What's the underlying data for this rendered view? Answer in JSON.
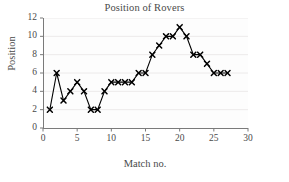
{
  "chart_data": {
    "type": "line",
    "title": "Position of Rovers",
    "xlabel": "Match no.",
    "ylabel": "Position",
    "x": [
      1,
      2,
      3,
      4,
      5,
      6,
      7,
      8,
      9,
      10,
      11,
      12,
      13,
      14,
      15,
      16,
      17,
      18,
      19,
      20,
      21,
      22,
      23,
      24,
      25,
      26,
      27
    ],
    "values": [
      2,
      6,
      3,
      4,
      5,
      4,
      2,
      2,
      4,
      5,
      5,
      5,
      5,
      6,
      6,
      8,
      9,
      10,
      10,
      11,
      10,
      8,
      8,
      7,
      6,
      6,
      6
    ],
    "series": [
      {
        "name": "Position",
        "values": [
          2,
          6,
          3,
          4,
          5,
          4,
          2,
          2,
          4,
          5,
          5,
          5,
          5,
          6,
          6,
          8,
          9,
          10,
          10,
          11,
          10,
          8,
          8,
          7,
          6,
          6,
          6
        ]
      }
    ],
    "xlim": [
      0,
      30
    ],
    "ylim": [
      0,
      12
    ],
    "xticks": [
      0,
      5,
      10,
      15,
      20,
      25,
      30
    ],
    "yticks": [
      0,
      2,
      4,
      6,
      8,
      10,
      12
    ],
    "xtick_labels": [
      "0",
      "5",
      "10",
      "15",
      "20",
      "25",
      "30"
    ],
    "ytick_labels": [
      "0",
      "2",
      "4",
      "6",
      "8",
      "10",
      "12"
    ],
    "grid": "horizontal",
    "legend": "none",
    "marker": "x-cross",
    "line_color": "#000000",
    "marker_color": "#000000",
    "grid_color": "#eceaea",
    "axis_color": "#7a7a7a",
    "background_color": "#ffffff"
  }
}
